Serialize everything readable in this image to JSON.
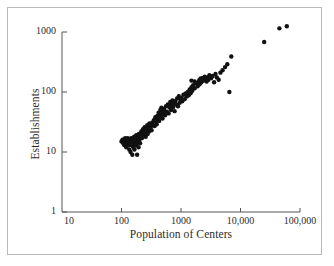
{
  "figure": {
    "background_color": "#ffffff",
    "frame_color": "#b9b9b9",
    "point_color": "#111111"
  },
  "chart_data": {
    "type": "scatter",
    "title": "",
    "xlabel": "Population of Centers",
    "ylabel": "Establishments",
    "xscale": "log",
    "yscale": "log",
    "xlim": [
      10,
      100000
    ],
    "ylim": [
      1,
      1000
    ],
    "grid": false,
    "legend": null,
    "xticks": [
      10,
      100,
      1000,
      10000,
      100000
    ],
    "xtick_labels": [
      "10",
      "100",
      "1000",
      "10,000",
      "100,000"
    ],
    "yticks": [
      1,
      10,
      100,
      1000
    ],
    "ytick_labels": [
      "1",
      "10",
      "100",
      "1000"
    ],
    "marker": "filled-circle",
    "marker_size_px": 3.2,
    "points": [
      [
        100,
        15
      ],
      [
        104,
        16
      ],
      [
        107,
        14
      ],
      [
        110,
        16
      ],
      [
        112,
        13
      ],
      [
        115,
        17
      ],
      [
        118,
        15
      ],
      [
        120,
        12
      ],
      [
        122,
        16
      ],
      [
        125,
        14
      ],
      [
        127,
        17
      ],
      [
        130,
        13
      ],
      [
        132,
        15
      ],
      [
        135,
        11
      ],
      [
        137,
        16
      ],
      [
        140,
        14
      ],
      [
        142,
        10
      ],
      [
        145,
        17
      ],
      [
        148,
        13
      ],
      [
        150,
        15
      ],
      [
        152,
        9
      ],
      [
        155,
        16
      ],
      [
        158,
        12
      ],
      [
        160,
        14
      ],
      [
        163,
        18
      ],
      [
        165,
        11
      ],
      [
        168,
        16
      ],
      [
        170,
        15
      ],
      [
        174,
        13
      ],
      [
        177,
        19
      ],
      [
        180,
        14
      ],
      [
        183,
        9
      ],
      [
        186,
        17
      ],
      [
        190,
        15
      ],
      [
        193,
        12
      ],
      [
        196,
        20
      ],
      [
        200,
        16
      ],
      [
        205,
        14
      ],
      [
        210,
        18
      ],
      [
        215,
        22
      ],
      [
        220,
        17
      ],
      [
        225,
        20
      ],
      [
        230,
        24
      ],
      [
        235,
        19
      ],
      [
        240,
        22
      ],
      [
        245,
        26
      ],
      [
        250,
        21
      ],
      [
        255,
        18
      ],
      [
        260,
        25
      ],
      [
        265,
        23
      ],
      [
        270,
        28
      ],
      [
        275,
        20
      ],
      [
        280,
        24
      ],
      [
        285,
        27
      ],
      [
        290,
        22
      ],
      [
        295,
        30
      ],
      [
        300,
        25
      ],
      [
        310,
        26
      ],
      [
        320,
        23
      ],
      [
        330,
        31
      ],
      [
        340,
        28
      ],
      [
        350,
        34
      ],
      [
        360,
        27
      ],
      [
        370,
        38
      ],
      [
        380,
        32
      ],
      [
        390,
        29
      ],
      [
        400,
        40
      ],
      [
        410,
        35
      ],
      [
        420,
        45
      ],
      [
        430,
        33
      ],
      [
        440,
        42
      ],
      [
        450,
        50
      ],
      [
        460,
        38
      ],
      [
        470,
        55
      ],
      [
        480,
        44
      ],
      [
        490,
        36
      ],
      [
        500,
        48
      ],
      [
        520,
        52
      ],
      [
        540,
        41
      ],
      [
        560,
        58
      ],
      [
        580,
        47
      ],
      [
        600,
        62
      ],
      [
        620,
        44
      ],
      [
        640,
        55
      ],
      [
        660,
        68
      ],
      [
        680,
        50
      ],
      [
        700,
        60
      ],
      [
        720,
        72
      ],
      [
        740,
        56
      ],
      [
        760,
        65
      ],
      [
        780,
        48
      ],
      [
        800,
        70
      ],
      [
        830,
        62
      ],
      [
        860,
        78
      ],
      [
        890,
        58
      ],
      [
        920,
        85
      ],
      [
        950,
        66
      ],
      [
        980,
        75
      ],
      [
        1000,
        80
      ],
      [
        1050,
        70
      ],
      [
        1100,
        90
      ],
      [
        1150,
        76
      ],
      [
        1200,
        95
      ],
      [
        1250,
        84
      ],
      [
        1300,
        100
      ],
      [
        1350,
        88
      ],
      [
        1400,
        110
      ],
      [
        1450,
        95
      ],
      [
        1500,
        120
      ],
      [
        1550,
        105
      ],
      [
        1600,
        130
      ],
      [
        1700,
        115
      ],
      [
        1800,
        140
      ],
      [
        1900,
        125
      ],
      [
        2000,
        150
      ],
      [
        2050,
        135
      ],
      [
        2100,
        160
      ],
      [
        2200,
        145
      ],
      [
        2300,
        170
      ],
      [
        2400,
        155
      ],
      [
        2500,
        180
      ],
      [
        2600,
        165
      ],
      [
        2700,
        150
      ],
      [
        2800,
        175
      ],
      [
        2900,
        160
      ],
      [
        3000,
        190
      ],
      [
        3200,
        170
      ],
      [
        3400,
        185
      ],
      [
        3600,
        145
      ],
      [
        3800,
        200
      ],
      [
        4000,
        175
      ],
      [
        4300,
        160
      ],
      [
        4600,
        210
      ],
      [
        5000,
        230
      ],
      [
        5500,
        260
      ],
      [
        6000,
        290
      ],
      [
        6500,
        100
      ],
      [
        7000,
        390
      ],
      [
        25000,
        680
      ],
      [
        45000,
        1150
      ],
      [
        60000,
        1250
      ],
      [
        1500,
        155
      ],
      [
        1700,
        150
      ],
      [
        2050,
        160
      ],
      [
        2150,
        168
      ],
      [
        640,
        60
      ],
      [
        520,
        46
      ],
      [
        470,
        40
      ],
      [
        360,
        33
      ],
      [
        300,
        28
      ],
      [
        255,
        24
      ],
      [
        205,
        19
      ],
      [
        170,
        16
      ],
      [
        145,
        14
      ],
      [
        128,
        15
      ],
      [
        118,
        13
      ]
    ]
  }
}
